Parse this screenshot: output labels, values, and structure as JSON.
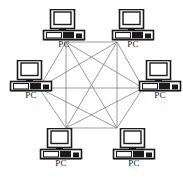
{
  "diagram": {
    "type": "network-topology",
    "topology": "full-mesh",
    "background_color": "#ffffff",
    "line_color": "#808080",
    "icon_color": "#1a1a1a",
    "label_color": "#1a1a1a",
    "node_count": 6,
    "link_count": 15,
    "icon_name": "desktop-computer-icon",
    "nodes": [
      {
        "id": "pc-top-left",
        "label": "PC",
        "icon": "desktop-computer-icon",
        "x": 66,
        "y": 42,
        "icon_left": 41,
        "icon_top": 9
      },
      {
        "id": "pc-top-right",
        "label": "PC",
        "icon": "desktop-computer-icon",
        "x": 117,
        "y": 42,
        "icon_left": 110,
        "icon_top": 9
      },
      {
        "id": "pc-left",
        "label": "PC",
        "icon": "desktop-computer-icon",
        "x": 39,
        "y": 88,
        "icon_left": 8,
        "icon_top": 60
      },
      {
        "id": "pc-right",
        "label": "PC",
        "icon": "desktop-computer-icon",
        "x": 143,
        "y": 88,
        "icon_left": 137,
        "icon_top": 60
      },
      {
        "id": "pc-bottom-left",
        "label": "PC",
        "icon": "desktop-computer-icon",
        "x": 66,
        "y": 128,
        "icon_left": 38,
        "icon_top": 128
      },
      {
        "id": "pc-bottom-right",
        "label": "PC",
        "icon": "desktop-computer-icon",
        "x": 117,
        "y": 128,
        "icon_left": 111,
        "icon_top": 128
      }
    ],
    "links": [
      {
        "from": "pc-top-left",
        "to": "pc-top-right"
      },
      {
        "from": "pc-top-left",
        "to": "pc-left"
      },
      {
        "from": "pc-top-left",
        "to": "pc-right"
      },
      {
        "from": "pc-top-left",
        "to": "pc-bottom-left"
      },
      {
        "from": "pc-top-left",
        "to": "pc-bottom-right"
      },
      {
        "from": "pc-top-right",
        "to": "pc-left"
      },
      {
        "from": "pc-top-right",
        "to": "pc-right"
      },
      {
        "from": "pc-top-right",
        "to": "pc-bottom-left"
      },
      {
        "from": "pc-top-right",
        "to": "pc-bottom-right"
      },
      {
        "from": "pc-left",
        "to": "pc-right"
      },
      {
        "from": "pc-left",
        "to": "pc-bottom-left"
      },
      {
        "from": "pc-left",
        "to": "pc-bottom-right"
      },
      {
        "from": "pc-right",
        "to": "pc-bottom-left"
      },
      {
        "from": "pc-right",
        "to": "pc-bottom-right"
      },
      {
        "from": "pc-bottom-left",
        "to": "pc-bottom-right"
      }
    ]
  }
}
